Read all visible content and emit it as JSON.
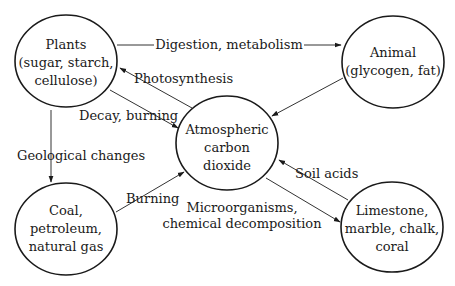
{
  "diagram": {
    "nodes": [
      {
        "id": "plants",
        "lines": [
          "Plants",
          "(sugar, starch,",
          "cellulose)"
        ]
      },
      {
        "id": "animal",
        "lines": [
          "Animal",
          "(glycogen, fat)"
        ]
      },
      {
        "id": "co2",
        "lines": [
          "Atmospheric",
          "carbon",
          "dioxide"
        ]
      },
      {
        "id": "coal",
        "lines": [
          "Coal,",
          "petroleum,",
          "natural gas"
        ]
      },
      {
        "id": "limestone",
        "lines": [
          "Limestone,",
          "marble, chalk,",
          "coral"
        ]
      }
    ],
    "edges": [
      {
        "from": "plants",
        "to": "animal",
        "label": "Digestion, metabolism"
      },
      {
        "from": "co2",
        "to": "plants",
        "label": "Photosynthesis"
      },
      {
        "from": "plants",
        "to": "co2",
        "label": "Decay, burning"
      },
      {
        "from": "animal",
        "to": "co2",
        "label": ""
      },
      {
        "from": "plants",
        "to": "coal",
        "label": "Geological changes"
      },
      {
        "from": "coal",
        "to": "co2",
        "label": "Burning"
      },
      {
        "from": "limestone",
        "to": "co2",
        "label": "Soil acids"
      },
      {
        "from": "co2",
        "to": "limestone",
        "label": "Microorganisms, chemical decomposition",
        "label_lines": [
          "Microorganisms,",
          "chemical decomposition"
        ]
      }
    ]
  }
}
